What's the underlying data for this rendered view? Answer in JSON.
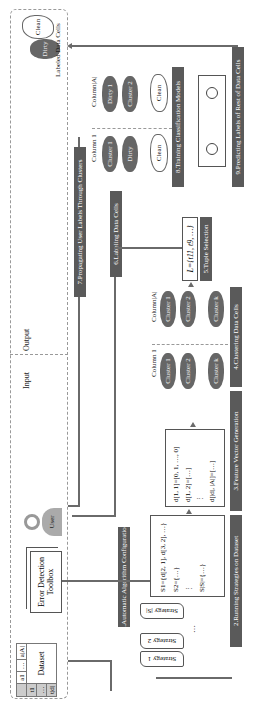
{
  "diagram": {
    "orientation": "rotated-90-ccw",
    "regions": {
      "input_label": "Input",
      "output_label": "Output"
    },
    "input": {
      "dataset": {
        "label": "Dataset",
        "columns": [
          "a1",
          "…",
          "a|A|"
        ],
        "rows": [
          "t1",
          "…",
          "t|d|"
        ]
      },
      "toolbox": {
        "label": "Error Detection Toolbox"
      },
      "user": {
        "label": "User"
      }
    },
    "steps": [
      {
        "id": 1,
        "label": "1.Automatic Algorithm Configuration"
      },
      {
        "id": 2,
        "label": "2.Running Strategies on Dataset"
      },
      {
        "id": 3,
        "label": "3.Feature Vector Generation"
      },
      {
        "id": 4,
        "label": "4.Clustering Data Cells"
      },
      {
        "id": 5,
        "label": "5.Tuple Selection"
      },
      {
        "id": 6,
        "label": "6.Labeling Data Cells"
      },
      {
        "id": 7,
        "label": "7.Propagating User Labels Through Clusters"
      },
      {
        "id": 8,
        "label": "8.Training Classification Models"
      },
      {
        "id": 9,
        "label": "9.Predicting Labels of Rest of Data Cells"
      }
    ],
    "strategies": [
      "Strategy 1",
      "Strategy 2",
      "…",
      "Strategy |S|"
    ],
    "strategy_outputs": [
      "S1={d[2, 1], d[3, 2], …}",
      "S2={…}",
      "⋮",
      "S|S|={…}"
    ],
    "feature_vectors": [
      "d[1, 1]=[0, 1, …, 0]",
      "d[1, 2]=[…]",
      "⋮",
      "d[|d|, |A|]=[…]"
    ],
    "clustering": {
      "column_first": "Column 1",
      "column_last": "Column|A|",
      "ellipsis": "…",
      "clusters": [
        "Cluster 1",
        "Cluster 2",
        "⋮",
        "Cluster k"
      ]
    },
    "tuple_selection": {
      "formula": "L={t11, t9, …}"
    },
    "propagation": {
      "column_first": "Column 1",
      "column_last": "Column|A|",
      "col1_items": [
        "Cluster 1",
        "Dirty",
        "⋮",
        "Clean"
      ],
      "colA_items": [
        "Dirty 1",
        "Cluster 2",
        "⋮",
        "Clean"
      ]
    },
    "output": {
      "label": "Labeled Data Cells",
      "items": [
        "Dirty",
        "Clean"
      ]
    }
  }
}
